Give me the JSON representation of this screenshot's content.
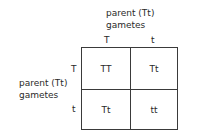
{
  "top_parent": {
    "line1": "parent (Tt)",
    "line2": "gametes"
  },
  "left_parent": {
    "line1": "parent (Tt)",
    "line2": "gametes"
  },
  "column_gametes": [
    "T",
    "t"
  ],
  "row_gametes": [
    "T",
    "t"
  ],
  "cells": [
    [
      "TT",
      "Tt"
    ],
    [
      "Tt",
      "tt"
    ]
  ]
}
